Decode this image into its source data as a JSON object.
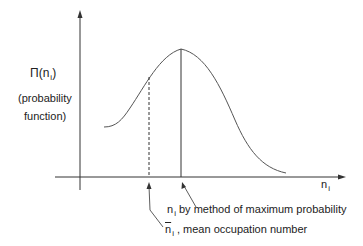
{
  "diagram": {
    "y_axis_label": {
      "symbol": "Π(n",
      "subscript": "i",
      "close": ")",
      "line2": "(probability",
      "line3": "function)"
    },
    "x_axis_label": {
      "symbol": "n",
      "subscript": "i"
    },
    "annotations": [
      {
        "symbol": "n",
        "subscript": "i",
        "text": " by method of maximum probability"
      },
      {
        "symbol": "n",
        "subscript": "i",
        "text": " , mean occupation number",
        "overbar": true
      }
    ],
    "colors": {
      "curve": "#555555",
      "axis": "#333333",
      "text": "#222222"
    }
  }
}
